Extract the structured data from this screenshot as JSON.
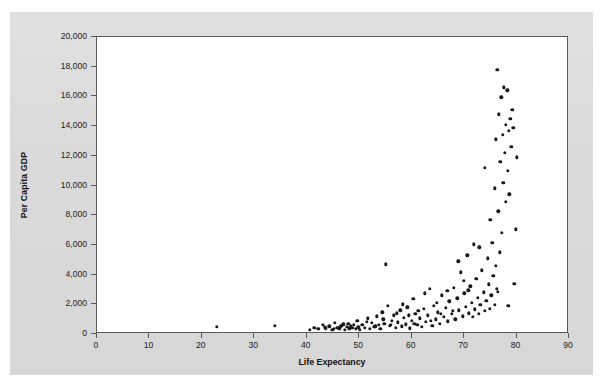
{
  "figure": {
    "panel_background": "#dcdcdc",
    "plot_background": "#ffffff",
    "frame_color": "#595959",
    "marker_color": "#1a1a1a"
  },
  "chart_data": {
    "type": "scatter",
    "title": "",
    "xlabel": "Life Expectancy",
    "ylabel": "Per Capita GDP",
    "xlim": [
      0,
      90
    ],
    "ylim": [
      0,
      20000
    ],
    "xticks": [
      0,
      10,
      20,
      30,
      40,
      50,
      60,
      70,
      80,
      90
    ],
    "xtick_labels": [
      "0",
      "10",
      "20",
      "30",
      "40",
      "50",
      "60",
      "70",
      "80",
      "90"
    ],
    "yticks": [
      0,
      2000,
      4000,
      6000,
      8000,
      10000,
      12000,
      14000,
      16000,
      18000,
      20000
    ],
    "ytick_labels": [
      "0",
      "2,000",
      "4,000",
      "6,000",
      "8,000",
      "10,000",
      "12,000",
      "14,000",
      "16,000",
      "18,000",
      "20,000"
    ],
    "grid": false,
    "legend": null,
    "marker": "filled-circle",
    "points": [
      [
        22.8,
        480
      ],
      [
        33.9,
        540
      ],
      [
        40.6,
        290
      ],
      [
        41.4,
        420
      ],
      [
        42.2,
        330
      ],
      [
        43.1,
        600
      ],
      [
        43.6,
        380
      ],
      [
        44.3,
        510
      ],
      [
        44.9,
        300
      ],
      [
        45.4,
        760
      ],
      [
        45.8,
        430
      ],
      [
        46.2,
        350
      ],
      [
        46.6,
        560
      ],
      [
        47.0,
        640
      ],
      [
        47.3,
        290
      ],
      [
        47.6,
        470
      ],
      [
        47.9,
        700
      ],
      [
        48.2,
        330
      ],
      [
        48.4,
        520
      ],
      [
        48.7,
        410
      ],
      [
        49.0,
        600
      ],
      [
        49.3,
        350
      ],
      [
        49.6,
        880
      ],
      [
        50.1,
        290
      ],
      [
        50.6,
        620
      ],
      [
        51.1,
        430
      ],
      [
        51.6,
        1050
      ],
      [
        52.0,
        360
      ],
      [
        52.4,
        760
      ],
      [
        52.9,
        480
      ],
      [
        53.3,
        1180
      ],
      [
        53.7,
        620
      ],
      [
        54.0,
        340
      ],
      [
        54.4,
        1450
      ],
      [
        54.8,
        700
      ],
      [
        55.1,
        4700
      ],
      [
        55.4,
        1900
      ],
      [
        55.8,
        560
      ],
      [
        56.2,
        900
      ],
      [
        56.6,
        1250
      ],
      [
        57.0,
        430
      ],
      [
        57.4,
        780
      ],
      [
        57.8,
        1600
      ],
      [
        58.1,
        520
      ],
      [
        58.5,
        1100
      ],
      [
        58.9,
        640
      ],
      [
        59.2,
        1800
      ],
      [
        59.6,
        380
      ],
      [
        60.0,
        900
      ],
      [
        60.3,
        2350
      ],
      [
        60.7,
        1350
      ],
      [
        61.1,
        620
      ],
      [
        61.5,
        1050
      ],
      [
        61.9,
        480
      ],
      [
        62.3,
        1700
      ],
      [
        62.7,
        820
      ],
      [
        63.1,
        1250
      ],
      [
        63.5,
        3050
      ],
      [
        63.9,
        560
      ],
      [
        64.2,
        1900
      ],
      [
        64.6,
        980
      ],
      [
        65.0,
        1450
      ],
      [
        65.4,
        700
      ],
      [
        65.8,
        2600
      ],
      [
        66.1,
        1150
      ],
      [
        66.5,
        1750
      ],
      [
        66.9,
        850
      ],
      [
        67.2,
        2200
      ],
      [
        67.6,
        1350
      ],
      [
        68.0,
        3100
      ],
      [
        68.3,
        1000
      ],
      [
        68.7,
        2400
      ],
      [
        69.0,
        1600
      ],
      [
        69.4,
        4150
      ],
      [
        69.7,
        1200
      ],
      [
        70.0,
        2750
      ],
      [
        70.3,
        1850
      ],
      [
        70.6,
        5300
      ],
      [
        70.9,
        1400
      ],
      [
        71.2,
        3200
      ],
      [
        71.5,
        2100
      ],
      [
        71.8,
        6050
      ],
      [
        72.0,
        1650
      ],
      [
        72.3,
        3700
      ],
      [
        72.6,
        2450
      ],
      [
        72.9,
        5850
      ],
      [
        73.1,
        1950
      ],
      [
        73.4,
        4300
      ],
      [
        73.7,
        2800
      ],
      [
        74.0,
        11200
      ],
      [
        74.2,
        2250
      ],
      [
        74.5,
        5100
      ],
      [
        74.7,
        3350
      ],
      [
        75.0,
        7700
      ],
      [
        75.2,
        2600
      ],
      [
        75.4,
        6150
      ],
      [
        75.6,
        3900
      ],
      [
        75.8,
        9800
      ],
      [
        76.0,
        13100
      ],
      [
        76.1,
        4600
      ],
      [
        76.3,
        17800
      ],
      [
        76.5,
        8250
      ],
      [
        76.6,
        14800
      ],
      [
        76.8,
        5500
      ],
      [
        76.9,
        11600
      ],
      [
        77.1,
        15950
      ],
      [
        77.2,
        6800
      ],
      [
        77.4,
        13400
      ],
      [
        77.5,
        10200
      ],
      [
        77.6,
        16600
      ],
      [
        77.8,
        12200
      ],
      [
        77.9,
        8900
      ],
      [
        78.0,
        14100
      ],
      [
        78.2,
        16400
      ],
      [
        78.3,
        11000
      ],
      [
        78.5,
        13700
      ],
      [
        78.6,
        9400
      ],
      [
        78.8,
        14500
      ],
      [
        79.0,
        12600
      ],
      [
        79.2,
        15100
      ],
      [
        79.4,
        13900
      ],
      [
        79.6,
        3400
      ],
      [
        79.8,
        7050
      ],
      [
        80.1,
        11900
      ],
      [
        76.2,
        3050
      ],
      [
        76.4,
        2850
      ],
      [
        75.9,
        1950
      ],
      [
        74.9,
        1700
      ],
      [
        73.9,
        1550
      ],
      [
        72.8,
        1350
      ],
      [
        71.7,
        1150
      ],
      [
        70.8,
        2950
      ],
      [
        69.9,
        3600
      ],
      [
        68.9,
        4900
      ],
      [
        67.9,
        1550
      ],
      [
        66.8,
        2900
      ],
      [
        65.6,
        1350
      ],
      [
        64.8,
        2100
      ],
      [
        63.7,
        890
      ],
      [
        62.5,
        2750
      ],
      [
        61.3,
        1550
      ],
      [
        60.5,
        690
      ],
      [
        59.4,
        1250
      ],
      [
        58.3,
        2000
      ],
      [
        57.2,
        1400
      ],
      [
        56.0,
        610
      ],
      [
        54.6,
        990
      ],
      [
        53.1,
        520
      ],
      [
        51.4,
        840
      ],
      [
        49.8,
        440
      ],
      [
        48.0,
        390
      ],
      [
        46.4,
        480
      ],
      [
        45.1,
        360
      ],
      [
        43.4,
        450
      ],
      [
        78.4,
        1900
      ]
    ]
  }
}
